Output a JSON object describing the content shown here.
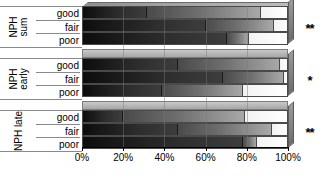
{
  "chart_data": {
    "type": "bar",
    "orientation": "horizontal",
    "stacked": true,
    "stacked_percent": true,
    "title": "",
    "xlabel": "",
    "ylabel": "",
    "xlim": [
      0,
      100
    ],
    "grid": true,
    "legend": "none",
    "xticks": [
      "0%",
      "20%",
      "40%",
      "60%",
      "80%",
      "100%"
    ],
    "xtick_values": [
      0,
      20,
      40,
      60,
      80,
      100
    ],
    "groups": [
      {
        "name": "NPH sum",
        "name_lines": [
          "NPH",
          "sum"
        ],
        "significance": "**",
        "categories": [
          "good",
          "fair",
          "poor"
        ],
        "bars": [
          {
            "category": "good",
            "values": [
              31,
              56,
              13
            ]
          },
          {
            "category": "fair",
            "values": [
              60,
              33,
              7
            ]
          },
          {
            "category": "poor",
            "values": [
              70,
              11,
              19
            ]
          }
        ]
      },
      {
        "name": "NPH early",
        "name_lines": [
          "NPH",
          "early"
        ],
        "significance": "*",
        "categories": [
          "good",
          "fair",
          "poor"
        ],
        "bars": [
          {
            "category": "good",
            "values": [
              46,
              50,
              4
            ]
          },
          {
            "category": "fair",
            "values": [
              68,
              30,
              2
            ]
          },
          {
            "category": "poor",
            "values": [
              38,
              40,
              22
            ]
          }
        ]
      },
      {
        "name": "NPH late",
        "name_lines": [
          "NPH late"
        ],
        "significance": "**",
        "categories": [
          "good",
          "fair",
          "poor"
        ],
        "bars": [
          {
            "category": "good",
            "values": [
              19,
              60,
              21
            ]
          },
          {
            "category": "fair",
            "values": [
              46,
              46,
              8
            ]
          },
          {
            "category": "poor",
            "values": [
              78,
              7,
              15
            ]
          }
        ]
      }
    ],
    "series": [
      {
        "name": "segment-1",
        "color": "#1a1a1a"
      },
      {
        "name": "segment-2",
        "color": "#7a7a7a"
      },
      {
        "name": "segment-3",
        "color": "#ffffff"
      }
    ]
  }
}
